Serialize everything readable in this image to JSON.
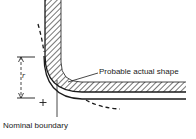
{
  "diagram": {
    "labels": {
      "probable_actual_shape": "Probable actual shape",
      "nominal_boundary": "Nominal boundary",
      "radius_symbol": "r",
      "center_mark": "+"
    },
    "colors": {
      "ink": "#1a1a1a",
      "background": "#ffffff"
    }
  }
}
